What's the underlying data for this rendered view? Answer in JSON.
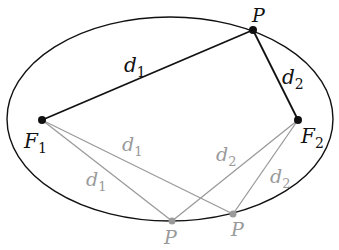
{
  "diagram": {
    "colors": {
      "primary": "#111111",
      "secondary": "#9a9a9a",
      "background": "#ffffff"
    },
    "labels": {
      "focus1": {
        "main": "F",
        "sub": "1"
      },
      "focus2": {
        "main": "F",
        "sub": "2"
      },
      "point_top": "P",
      "point_bottom_left": "P",
      "point_bottom_right": "P",
      "d1_top": {
        "main": "d",
        "sub": "1"
      },
      "d2_top": {
        "main": "d",
        "sub": "2"
      },
      "d1_lower_inner": {
        "main": "d",
        "sub": "1"
      },
      "d1_lower_outer": {
        "main": "d",
        "sub": "1"
      },
      "d2_lower_inner": {
        "main": "d",
        "sub": "2"
      },
      "d2_lower_outer": {
        "main": "d",
        "sub": "2"
      }
    }
  }
}
